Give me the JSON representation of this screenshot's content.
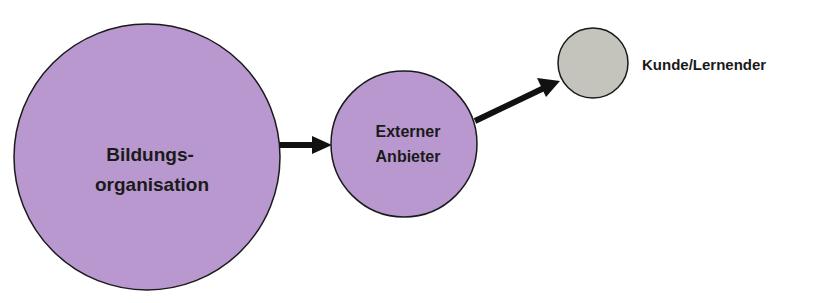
{
  "diagram": {
    "type": "flow",
    "nodes": [
      {
        "id": "bildung",
        "label_lines": [
          "Bildungs-",
          "organisation"
        ],
        "shape": "circle",
        "fill": "#b898cf",
        "cx": 147,
        "cy": 157,
        "r": 133
      },
      {
        "id": "extern",
        "label_lines": [
          "Externer",
          "Anbieter"
        ],
        "shape": "circle",
        "fill": "#b898cf",
        "cx": 404,
        "cy": 144,
        "r": 73
      },
      {
        "id": "kunde",
        "label": "Kunde/Lernender",
        "shape": "circle",
        "fill": "#c4c4bc",
        "cx": 593,
        "cy": 63,
        "r": 35
      }
    ],
    "edges": [
      {
        "from": "bildung",
        "to": "extern"
      },
      {
        "from": "extern",
        "to": "kunde"
      }
    ],
    "colors": {
      "primary_fill": "#b898cf",
      "secondary_fill": "#c4c4bc",
      "stroke": "#1a1a1a"
    }
  }
}
